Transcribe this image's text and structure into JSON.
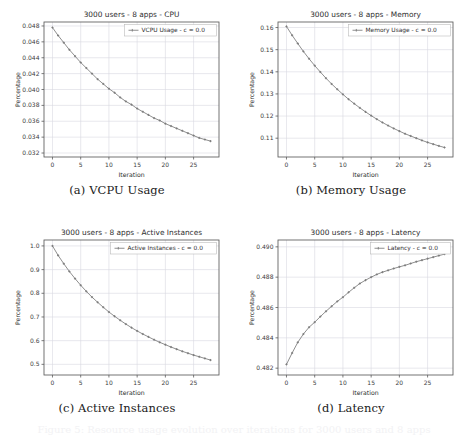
{
  "page": {
    "background_color": "#ffffff",
    "line_color": "#7a7a7a",
    "grid_color": "#d9d9e0",
    "axis_color": "#5a5a5a",
    "text_color": "#3d3d3d",
    "bottom_cutoff_text": "Figure 5: Resource usage evolution over iterations for 3000 users and 8 apps"
  },
  "figures": [
    {
      "id": "a",
      "caption": "(a) VCPU Usage",
      "chart_data": {
        "type": "line",
        "title": "3000 users - 8 apps - CPU",
        "xlabel": "Iteration",
        "ylabel": "Percentage",
        "legend": [
          "VCPU Usage - c = 0.0"
        ],
        "legend_position": "upper right",
        "grid": true,
        "xlim": [
          -1.5,
          29.5
        ],
        "ylim": [
          0.0315,
          0.0485
        ],
        "xticks": [
          0,
          5,
          10,
          15,
          20,
          25
        ],
        "yticks": [
          0.032,
          0.034,
          0.036,
          0.038,
          0.04,
          0.042,
          0.044,
          0.046,
          0.048
        ],
        "ytick_labels": [
          "0.032",
          "0.034",
          "0.036",
          "0.038",
          "0.040",
          "0.042",
          "0.044",
          "0.046",
          "0.048"
        ],
        "x": [
          0,
          1,
          2,
          3,
          4,
          5,
          6,
          7,
          8,
          9,
          10,
          11,
          12,
          13,
          14,
          15,
          16,
          17,
          18,
          19,
          20,
          21,
          22,
          23,
          24,
          25,
          26,
          27,
          28
        ],
        "series": [
          {
            "name": "VCPU Usage - c = 0.0",
            "values": [
              0.0478,
              0.0468,
              0.0459,
              0.045,
              0.0442,
              0.0434,
              0.0427,
              0.042,
              0.0413,
              0.0407,
              0.0401,
              0.0396,
              0.039,
              0.0385,
              0.0381,
              0.0376,
              0.0372,
              0.0368,
              0.0364,
              0.0361,
              0.0357,
              0.0354,
              0.0351,
              0.0348,
              0.0345,
              0.0342,
              0.0339,
              0.0337,
              0.0335
            ]
          }
        ]
      }
    },
    {
      "id": "b",
      "caption": "(b) Memory Usage",
      "chart_data": {
        "type": "line",
        "title": "3000 users - 8 apps - Memory",
        "xlabel": "Iteration",
        "ylabel": "Percentage",
        "legend": [
          "Memory Usage - c = 0.0"
        ],
        "legend_position": "upper right",
        "grid": true,
        "xlim": [
          -1.5,
          29.5
        ],
        "ylim": [
          0.1015,
          0.1625
        ],
        "xticks": [
          0,
          5,
          10,
          15,
          20,
          25
        ],
        "yticks": [
          0.11,
          0.12,
          0.13,
          0.14,
          0.15,
          0.16
        ],
        "ytick_labels": [
          "0.11",
          "0.12",
          "0.13",
          "0.14",
          "0.15",
          "0.16"
        ],
        "x": [
          0,
          1,
          2,
          3,
          4,
          5,
          6,
          7,
          8,
          9,
          10,
          11,
          12,
          13,
          14,
          15,
          16,
          17,
          18,
          19,
          20,
          21,
          22,
          23,
          24,
          25,
          26,
          27,
          28
        ],
        "series": [
          {
            "name": "Memory Usage - c = 0.0",
            "values": [
              0.1605,
              0.1565,
              0.1528,
              0.1492,
              0.1459,
              0.1428,
              0.1399,
              0.1371,
              0.1345,
              0.1321,
              0.1298,
              0.1276,
              0.1256,
              0.1237,
              0.1219,
              0.1202,
              0.1186,
              0.1171,
              0.1157,
              0.1144,
              0.1132,
              0.112,
              0.111,
              0.11,
              0.109,
              0.1081,
              0.1073,
              0.1065,
              0.1058
            ]
          }
        ]
      }
    },
    {
      "id": "c",
      "caption": "(c) Active Instances",
      "chart_data": {
        "type": "line",
        "title": "3000 users - 8 apps - Active Instances",
        "xlabel": "Iteration",
        "ylabel": "Percentage",
        "legend": [
          "Active Instances - c = 0.0"
        ],
        "legend_position": "upper right",
        "grid": true,
        "xlim": [
          -1.5,
          29.5
        ],
        "ylim": [
          0.455,
          1.025
        ],
        "xticks": [
          0,
          5,
          10,
          15,
          20,
          25
        ],
        "yticks": [
          0.5,
          0.6,
          0.7,
          0.8,
          0.9,
          1.0
        ],
        "ytick_labels": [
          "0.5",
          "0.6",
          "0.7",
          "0.8",
          "0.9",
          "1.0"
        ],
        "x": [
          0,
          1,
          2,
          3,
          4,
          5,
          6,
          7,
          8,
          9,
          10,
          11,
          12,
          13,
          14,
          15,
          16,
          17,
          18,
          19,
          20,
          21,
          22,
          23,
          24,
          25,
          26,
          27,
          28
        ],
        "series": [
          {
            "name": "Active Instances - c = 0.0",
            "values": [
              1.0,
              0.96,
              0.925,
              0.892,
              0.862,
              0.834,
              0.808,
              0.784,
              0.762,
              0.741,
              0.721,
              0.703,
              0.686,
              0.67,
              0.655,
              0.641,
              0.628,
              0.616,
              0.604,
              0.593,
              0.583,
              0.573,
              0.564,
              0.555,
              0.547,
              0.539,
              0.532,
              0.525,
              0.518
            ]
          }
        ]
      }
    },
    {
      "id": "d",
      "caption": "(d) Latency",
      "chart_data": {
        "type": "line",
        "title": "3000 users - 8 apps - Latency",
        "xlabel": "Iteration",
        "ylabel": "Percentage",
        "legend": [
          "Latency - c = 0.0"
        ],
        "legend_position": "upper right",
        "grid": true,
        "xlim": [
          -1.5,
          29.5
        ],
        "ylim": [
          0.48155,
          0.49045
        ],
        "xticks": [
          0,
          5,
          10,
          15,
          20,
          25
        ],
        "yticks": [
          0.482,
          0.484,
          0.486,
          0.488,
          0.49
        ],
        "ytick_labels": [
          "0.482",
          "0.484",
          "0.486",
          "0.488",
          "0.490"
        ],
        "x": [
          0,
          1,
          2,
          3,
          4,
          5,
          6,
          7,
          8,
          9,
          10,
          11,
          12,
          13,
          14,
          15,
          16,
          17,
          18,
          19,
          20,
          21,
          22,
          23,
          24,
          25,
          26,
          27,
          28
        ],
        "series": [
          {
            "name": "Latency - c = 0.0",
            "values": [
              0.48225,
              0.483,
              0.4837,
              0.48425,
              0.4847,
              0.48503,
              0.4854,
              0.48575,
              0.48608,
              0.4864,
              0.48668,
              0.487,
              0.4873,
              0.48758,
              0.4878,
              0.488,
              0.48818,
              0.48833,
              0.48845,
              0.48857,
              0.48868,
              0.48878,
              0.4889,
              0.48902,
              0.48912,
              0.48922,
              0.48932,
              0.48942,
              0.48952
            ]
          }
        ]
      }
    }
  ]
}
